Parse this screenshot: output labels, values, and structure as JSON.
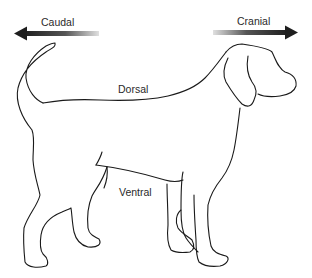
{
  "diagram": {
    "labels": {
      "caudal": "Caudal",
      "cranial": "Cranial",
      "dorsal": "Dorsal",
      "ventral": "Ventral"
    },
    "colors": {
      "line": "#1a1a1a",
      "arrow_dark": "#222222",
      "arrow_light": "#dddddd",
      "text": "#2a2a2a"
    }
  }
}
